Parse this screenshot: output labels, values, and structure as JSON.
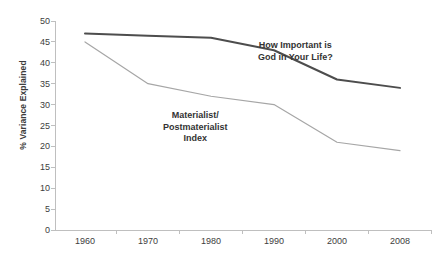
{
  "chart_data": {
    "type": "line",
    "title": "",
    "subtitle": "",
    "xlabel": "",
    "ylabel": "% Variance Explained",
    "x": [
      1960,
      1970,
      1980,
      1990,
      2000,
      2008
    ],
    "categories": [
      "1960",
      "1970",
      "1980",
      "1990",
      "2000",
      "2008"
    ],
    "ylim": [
      0,
      50
    ],
    "yticks": [
      0,
      5,
      10,
      15,
      20,
      25,
      30,
      35,
      40,
      45,
      50
    ],
    "ytick_labels": [
      "0",
      "5",
      "10",
      "15",
      "20",
      "25",
      "30",
      "35",
      "40",
      "45",
      "50"
    ],
    "xtick_labels": [
      "1960",
      "1970",
      "1980",
      "1990",
      "2000",
      "2008"
    ],
    "grid": false,
    "legend": "inline-annotations",
    "series": [
      {
        "name": "How Important is God in Your Life?",
        "label_line1": "How Important is",
        "label_line2": "God in Your Life?",
        "color": "#4d4d4d",
        "line_width": 2.0,
        "values": [
          47,
          46.5,
          46,
          43,
          36,
          34
        ]
      },
      {
        "name": "Materialist/Postmaterialist Index",
        "label_line1": "Materialist/",
        "label_line2": "Postmaterialist",
        "label_line3": "Index",
        "color": "#a6a6a6",
        "line_width": 1.2,
        "values": [
          45,
          35,
          32,
          30,
          21,
          19
        ]
      }
    ],
    "axis_color": "#bfbfbf",
    "text_color": "#3d3d3d",
    "background": "#ffffff"
  },
  "annotations": {
    "god": {
      "line1": "How Important is",
      "line2": "God in Your Life?"
    },
    "materialist": {
      "line1": "Materialist/",
      "line2": "Postmaterialist",
      "line3": "Index"
    }
  },
  "axes": {
    "y_title": "% Variance Explained"
  }
}
